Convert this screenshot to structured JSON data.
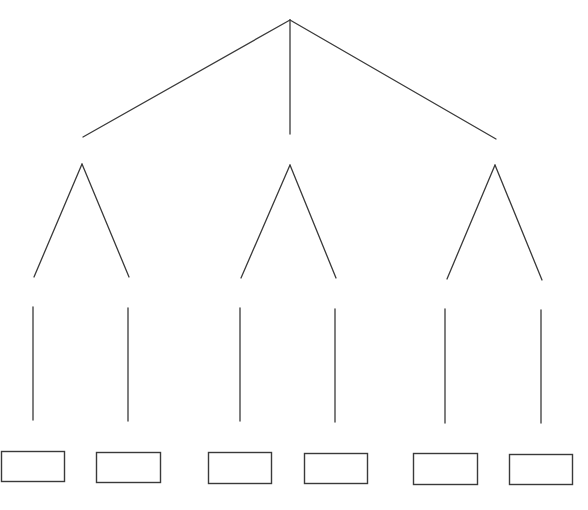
{
  "diagram": {
    "type": "tree",
    "stroke_color": "#3a3a3a",
    "background": "#ffffff",
    "root_branches": [
      {
        "x1": 290,
        "y1": 20,
        "x2": 83,
        "y2": 137
      },
      {
        "x1": 290,
        "y1": 20,
        "x2": 290,
        "y2": 134
      },
      {
        "x1": 290,
        "y1": 20,
        "x2": 496,
        "y2": 139
      }
    ],
    "subtrees": [
      {
        "apex": [
          82,
          164
        ],
        "left": [
          34,
          277
        ],
        "right": [
          129,
          277
        ]
      },
      {
        "apex": [
          290,
          165
        ],
        "left": [
          241,
          278
        ],
        "right": [
          336,
          278
        ]
      },
      {
        "apex": [
          495,
          165
        ],
        "left": [
          447,
          279
        ],
        "right": [
          542,
          280
        ]
      }
    ],
    "stems": [
      {
        "x": 33,
        "y1": 307,
        "y2": 420
      },
      {
        "x": 128,
        "y1": 308,
        "y2": 421
      },
      {
        "x": 240,
        "y1": 308,
        "y2": 421
      },
      {
        "x": 335,
        "y1": 309,
        "y2": 422
      },
      {
        "x": 445,
        "y1": 309,
        "y2": 423
      },
      {
        "x": 541,
        "y1": 310,
        "y2": 423
      }
    ],
    "leaf_boxes": [
      {
        "x": 1,
        "y": 451,
        "w": 63,
        "h": 30,
        "label": ""
      },
      {
        "x": 96,
        "y": 452,
        "w": 64,
        "h": 30,
        "label": ""
      },
      {
        "x": 208,
        "y": 452,
        "w": 63,
        "h": 31,
        "label": ""
      },
      {
        "x": 304,
        "y": 453,
        "w": 63,
        "h": 30,
        "label": ""
      },
      {
        "x": 413,
        "y": 453,
        "w": 64,
        "h": 31,
        "label": ""
      },
      {
        "x": 509,
        "y": 454,
        "w": 63,
        "h": 30,
        "label": ""
      }
    ]
  }
}
